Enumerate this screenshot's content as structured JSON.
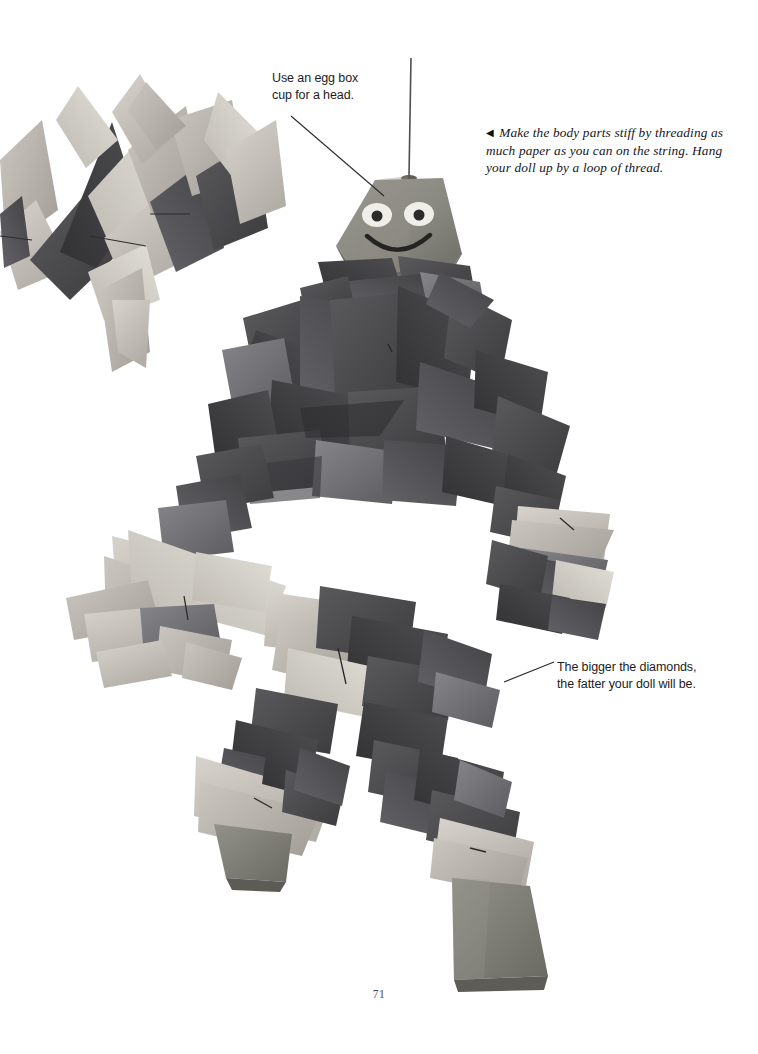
{
  "page": {
    "number": "71",
    "background_color": "#ffffff",
    "width": 758,
    "height": 1054
  },
  "annotations": [
    {
      "id": "head-note",
      "name": "annotation-egg-box-head",
      "lines": [
        "Use an egg box",
        "cup for a head."
      ],
      "text": "Use an egg box cup for a head.",
      "color": "#1c1c1c",
      "leader_line": {
        "x1": 291,
        "y1": 116,
        "x2": 384,
        "y2": 196
      }
    },
    {
      "id": "diamonds-note",
      "name": "annotation-bigger-diamonds",
      "lines": [
        "The bigger the diamonds,",
        "the fatter your doll will be."
      ],
      "text": "The bigger the diamonds, the fatter your doll will be.",
      "color": "#1c1c1c",
      "leader_line": {
        "x1": 504,
        "y1": 682,
        "x2": 553,
        "y2": 662
      }
    }
  ],
  "caption": {
    "marker": "◀",
    "marker_name": "left-triangle-marker",
    "lines": [
      "Make the body parts stiff by threading as",
      "much paper as you can on the string. Hang",
      "your doll up by a loop of thread."
    ],
    "text": "Make the body parts stiff by threading as much paper as you can on the string. Hang your doll up by a loop of thread."
  },
  "photo": {
    "subject": "paper-diamond-doll",
    "description": "Hanging doll made of folded paper diamonds threaded on string with egg box cup head and feet",
    "hanging_thread": {
      "x": 411,
      "y_top": 58,
      "y_bottom": 176
    },
    "palette": {
      "paper_dark": "#4b4b4e",
      "paper_darker": "#3a3a3d",
      "paper_mid": "#6e6e70",
      "paper_light": "#b9b5ae",
      "paper_lighter": "#cfcbc4",
      "paper_pale": "#e0ddd6",
      "egg_box": "#8d8c84",
      "egg_box_shadow": "#6f6e66",
      "face_white": "#efeee9",
      "face_dark": "#2a2a28",
      "thread": "#555555",
      "background": "#ffffff"
    },
    "head": {
      "name": "egg-box-cup-head",
      "face": {
        "left_eye": "white-oval-with-dark-pupil",
        "right_eye": "white-oval-with-dark-pupil",
        "mouth": "dark-smile-curve"
      }
    },
    "feet": [
      {
        "name": "left-foot-egg-box-cup"
      },
      {
        "name": "right-foot-egg-box-cup"
      }
    ],
    "top_left_cluster": {
      "name": "paper-diamond-strand",
      "description": "Separate strand of folded paper diamonds at upper left"
    }
  }
}
